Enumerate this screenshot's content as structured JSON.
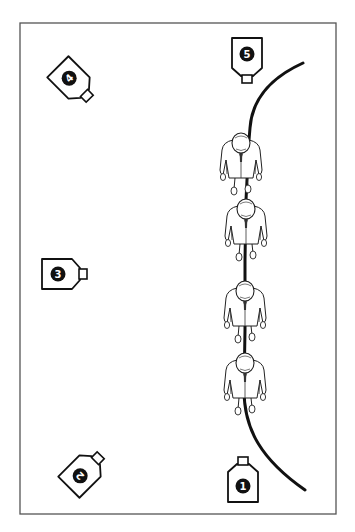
{
  "diagram": {
    "type": "camera placement diagram",
    "frame": {
      "x": 20,
      "y": 23,
      "width": 316,
      "height": 491,
      "stroke": "#555555"
    },
    "path": {
      "stroke": "#111111"
    },
    "cameras": [
      {
        "label": "1",
        "x": 243,
        "y": 478,
        "rotation": 0
      },
      {
        "label": "2",
        "x": 83,
        "y": 473,
        "rotation": -135
      },
      {
        "label": "3",
        "x": 58,
        "y": 274,
        "rotation": -90
      },
      {
        "label": "4",
        "x": 70,
        "y": 79,
        "rotation": -45
      },
      {
        "label": "5",
        "x": 247,
        "y": 56,
        "rotation": 180
      }
    ],
    "people": [
      {
        "name": "person-1",
        "x": 241,
        "y": 162
      },
      {
        "name": "person-2",
        "x": 246,
        "y": 228
      },
      {
        "name": "person-3",
        "x": 245,
        "y": 310
      },
      {
        "name": "person-4",
        "x": 245,
        "y": 382
      }
    ]
  }
}
